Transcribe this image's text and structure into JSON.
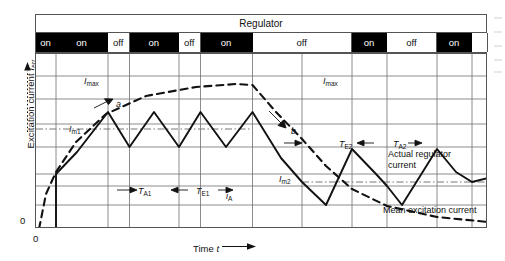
{
  "figure": {
    "type": "technical-waveform-diagram",
    "y_axis": {
      "label_text": "Excitation current",
      "symbol": "I",
      "symbol_sub": "err",
      "origin_tick": "0",
      "arrow": "up"
    },
    "x_axis": {
      "label_text": "Time",
      "symbol": "t",
      "origin_tick": "0",
      "arrow": "right"
    },
    "header_row": {
      "title": "Regulator"
    },
    "state_segments": [
      {
        "label": "on",
        "state": "on",
        "x": 0,
        "w": 20.0
      },
      {
        "label": "on",
        "state": "on",
        "x": 20.0,
        "w": 52.0
      },
      {
        "label": "off",
        "state": "off",
        "x": 72.0,
        "w": 21.5
      },
      {
        "label": "on",
        "state": "on",
        "x": 93.5,
        "w": 49.5
      },
      {
        "label": "off",
        "state": "off",
        "x": 143.0,
        "w": 21.5
      },
      {
        "label": "on",
        "state": "on",
        "x": 164.5,
        "w": 52.0
      },
      {
        "label": "off",
        "state": "off",
        "x": 216.5,
        "w": 99.5
      },
      {
        "label": "on",
        "state": "on",
        "x": 316.0,
        "w": 35.0
      },
      {
        "label": "off",
        "state": "off",
        "x": 351.0,
        "w": 50.0
      },
      {
        "label": "on",
        "state": "on",
        "x": 401.0,
        "w": 35.0
      },
      {
        "label": "",
        "state": "off",
        "x": 436.0,
        "w": 16.0
      }
    ],
    "annotations": [
      {
        "name": "i-max-left",
        "symbol": "I",
        "sub": "max",
        "x": 48,
        "y": 22
      },
      {
        "name": "i-max-right",
        "symbol": "I",
        "sub": "max",
        "x": 287,
        "y": 22
      },
      {
        "name": "i-m1",
        "symbol": "I",
        "sub": "m1",
        "x": 33,
        "y": 70
      },
      {
        "name": "i-m2",
        "symbol": "I",
        "sub": "m2",
        "x": 243,
        "y": 120
      },
      {
        "name": "i-a",
        "symbol": "i",
        "sub": "A",
        "x": 190,
        "y": 137
      },
      {
        "name": "t-a1",
        "symbol": "T",
        "sub": "A1",
        "x": 102,
        "y": 132
      },
      {
        "name": "t-e1",
        "symbol": "T",
        "sub": "E1",
        "x": 160,
        "y": 132
      },
      {
        "name": "t-e2",
        "symbol": "T",
        "sub": "E2",
        "x": 303,
        "y": 85
      },
      {
        "name": "t-a2",
        "symbol": "T",
        "sub": "A2",
        "x": 357,
        "y": 85
      },
      {
        "name": "curve-a",
        "symbol": "a",
        "sub": "",
        "x": 80,
        "y": 45
      },
      {
        "name": "curve-b",
        "symbol": "b",
        "sub": "",
        "x": 255,
        "y": 72
      }
    ],
    "text_labels": [
      {
        "name": "actual-regulator-current",
        "lines": [
          "Actual regulator",
          "current"
        ],
        "x": 352,
        "y": 95
      },
      {
        "name": "mean-excitation-current",
        "lines": [
          "Mean excitation current"
        ],
        "x": 347,
        "y": 151
      }
    ],
    "legend_note": {
      "solid_curve": "Actual regulator current",
      "dashed_curve": "Mean excitation current"
    },
    "colors": {
      "ink": "#111111",
      "grid": "#6e6e6e",
      "frame": "#555555",
      "on_fill": "#000000",
      "off_fill": "#ffffff",
      "dashdot": "#777777"
    }
  },
  "chart_data": {
    "type": "line",
    "title": "Regulator",
    "xlabel": "Time t",
    "ylabel": "Excitation current I_err",
    "xlim": [
      0,
      452
    ],
    "ylim": [
      0,
      175
    ],
    "grid": true,
    "legend_position": "inline-annotations",
    "horizontal_gridlines": [
      22,
      45,
      70,
      93,
      120,
      132,
      151
    ],
    "vertical_gridlines": [
      20,
      72,
      93.5,
      143,
      164.5,
      216.5,
      266,
      316,
      351,
      401,
      436
    ],
    "dashdot_levels": [
      {
        "name": "I_m1",
        "y": 75,
        "x0": 0,
        "x1": 216
      },
      {
        "name": "I_m2",
        "y": 128,
        "x0": 266,
        "x1": 452
      }
    ],
    "series": [
      {
        "name": "Actual regulator current",
        "style": "solid",
        "points": [
          [
            20,
            175
          ],
          [
            20,
            120
          ],
          [
            41,
            98
          ],
          [
            72,
            58
          ],
          [
            93.5,
            93
          ],
          [
            118,
            58
          ],
          [
            143,
            93
          ],
          [
            164.5,
            58
          ],
          [
            190,
            93
          ],
          [
            216.5,
            58
          ],
          [
            216.5,
            58
          ],
          [
            245,
            104
          ],
          [
            266,
            128
          ],
          [
            290,
            151
          ],
          [
            316,
            95
          ],
          [
            340,
            120
          ],
          [
            351,
            132
          ],
          [
            366,
            151
          ],
          [
            401,
            95
          ],
          [
            420,
            118
          ],
          [
            436,
            128
          ],
          [
            452,
            124
          ]
        ]
      },
      {
        "name": "Mean excitation current",
        "style": "dashed",
        "points": [
          [
            3,
            175
          ],
          [
            10,
            140
          ],
          [
            20,
            118
          ],
          [
            40,
            88
          ],
          [
            70,
            60
          ],
          [
            110,
            42
          ],
          [
            160,
            33
          ],
          [
            200,
            30
          ],
          [
            216.5,
            31
          ],
          [
            240,
            58
          ],
          [
            266,
            85
          ],
          [
            290,
            112
          ],
          [
            316,
            135
          ],
          [
            351,
            152
          ],
          [
            401,
            163
          ],
          [
            452,
            168
          ]
        ]
      }
    ]
  }
}
